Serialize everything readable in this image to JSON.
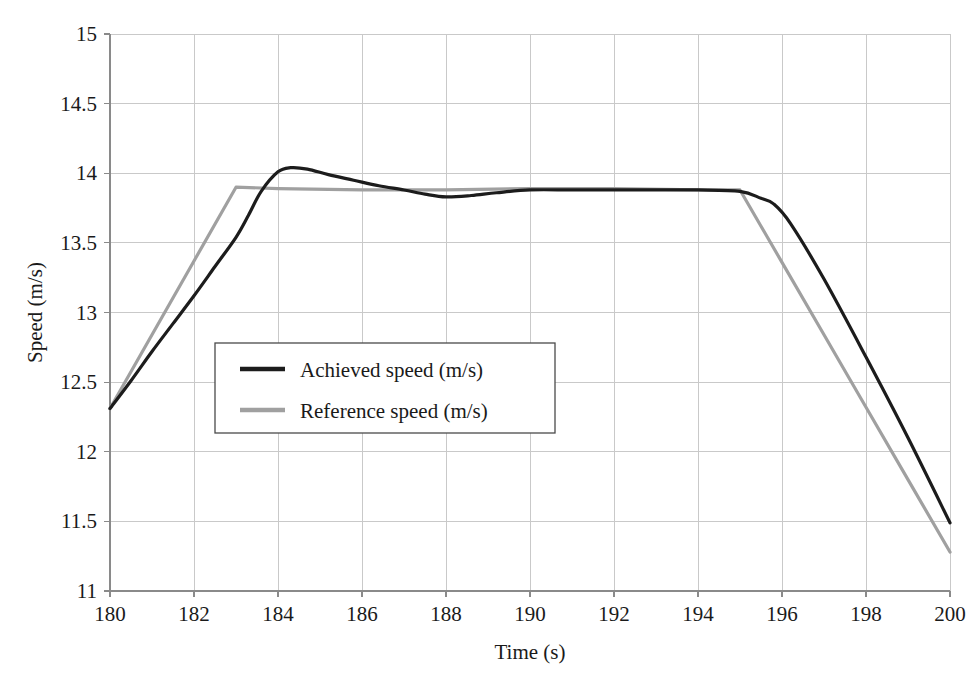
{
  "chart_data": {
    "type": "line",
    "title": "",
    "xlabel": "Time (s)",
    "ylabel": "Speed (m/s)",
    "xlim": [
      180,
      200
    ],
    "ylim": [
      11,
      15
    ],
    "xticks": [
      180,
      182,
      184,
      186,
      188,
      190,
      192,
      194,
      196,
      198,
      200
    ],
    "yticks": [
      11,
      11.5,
      12,
      12.5,
      13,
      13.5,
      14,
      14.5,
      15
    ],
    "xtick_labels": [
      "180",
      "182",
      "184",
      "186",
      "188",
      "190",
      "192",
      "194",
      "196",
      "198",
      "200"
    ],
    "ytick_labels": [
      "11",
      "11.5",
      "12",
      "12.5",
      "13",
      "13.5",
      "14",
      "14.5",
      "15"
    ],
    "grid": true,
    "legend_position": "center-left",
    "series": [
      {
        "name": "Achieved speed (m/s)",
        "color": "#1c1c1c",
        "width": 3.2,
        "x": [
          180.0,
          180.5,
          181.0,
          181.5,
          182.0,
          182.5,
          183.0,
          183.3,
          183.6,
          184.0,
          184.3,
          184.7,
          185.2,
          185.8,
          186.4,
          187.0,
          187.5,
          188.0,
          188.6,
          189.2,
          190.0,
          191.0,
          192.0,
          193.0,
          194.0,
          195.0,
          195.5,
          195.8,
          196.2,
          197.0,
          198.0,
          199.0,
          200.0
        ],
        "y": [
          12.31,
          12.51,
          12.72,
          12.92,
          13.12,
          13.33,
          13.54,
          13.7,
          13.87,
          14.01,
          14.04,
          14.03,
          13.99,
          13.95,
          13.91,
          13.88,
          13.85,
          13.83,
          13.84,
          13.86,
          13.88,
          13.88,
          13.88,
          13.88,
          13.88,
          13.87,
          13.82,
          13.78,
          13.64,
          13.24,
          12.68,
          12.1,
          11.49
        ]
      },
      {
        "name": "Reference speed (m/s)",
        "color": "#a0a0a0",
        "width": 3.2,
        "x": [
          180.0,
          181.0,
          182.0,
          183.0,
          184.0,
          186.0,
          188.0,
          190.0,
          192.0,
          194.0,
          195.0,
          196.0,
          197.0,
          198.0,
          199.0,
          200.0
        ],
        "y": [
          12.31,
          12.84,
          13.37,
          13.9,
          13.89,
          13.88,
          13.88,
          13.89,
          13.89,
          13.88,
          13.88,
          13.36,
          12.84,
          12.32,
          11.8,
          11.28
        ]
      }
    ],
    "legend_entries": [
      {
        "label": "Achieved speed (m/s)",
        "color": "#1c1c1c"
      },
      {
        "label": "Reference speed (m/s)",
        "color": "#a0a0a0"
      }
    ]
  },
  "plot_geometry": {
    "left": 110,
    "right": 950,
    "top": 34,
    "bottom": 591,
    "legend": {
      "x": 215,
      "y": 343,
      "w": 340,
      "h": 90
    }
  }
}
